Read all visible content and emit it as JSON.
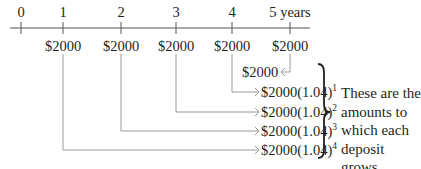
{
  "timeline": {
    "ticks": [
      {
        "label": "0",
        "x": 21
      },
      {
        "label": "1",
        "x": 63
      },
      {
        "label": "2",
        "x": 121
      },
      {
        "label": "3",
        "x": 176
      },
      {
        "label": "4",
        "x": 232
      },
      {
        "label": "5 years",
        "x": 290
      }
    ],
    "deposits": [
      {
        "year": 1,
        "amount": "$2000"
      },
      {
        "year": 2,
        "amount": "$2000"
      },
      {
        "year": 3,
        "amount": "$2000"
      },
      {
        "year": 4,
        "amount": "$2000"
      },
      {
        "year": 5,
        "amount": "$2000"
      }
    ]
  },
  "results": [
    {
      "base": "$2000",
      "exponent": ""
    },
    {
      "base": "$2000(1.04)",
      "exponent": "1"
    },
    {
      "base": "$2000(1.04)",
      "exponent": "2"
    },
    {
      "base": "$2000(1.04)",
      "exponent": "3"
    },
    {
      "base": "$2000(1.04)",
      "exponent": "4"
    }
  ],
  "note": {
    "lines": [
      "These are the",
      "amounts to",
      "which each",
      "deposit grows."
    ]
  },
  "colors": {
    "text": "#231f20",
    "axis": "#555555",
    "connector": "#9a9a9a"
  }
}
